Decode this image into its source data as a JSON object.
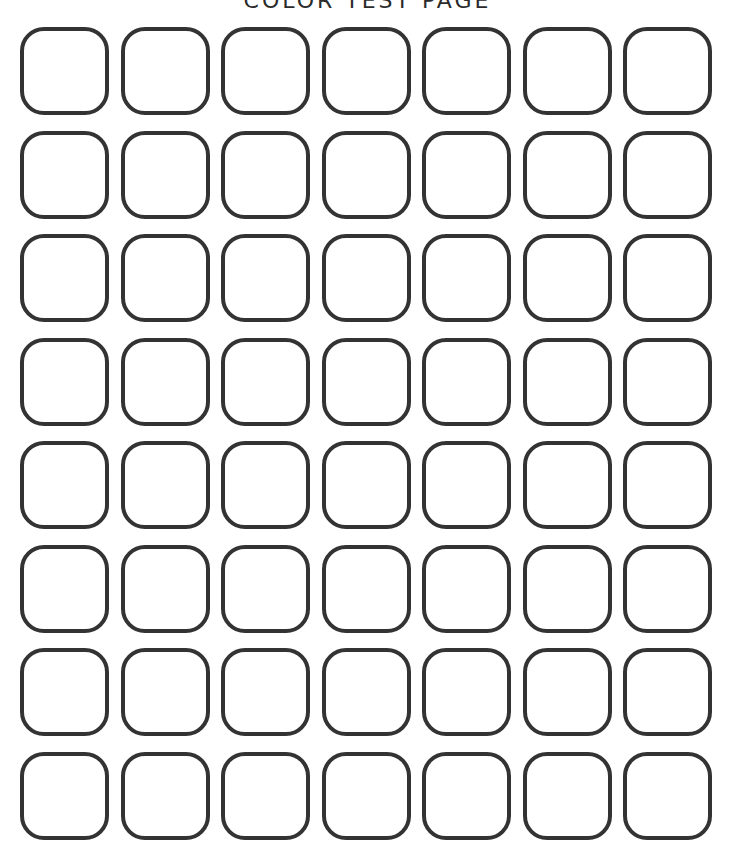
{
  "page": {
    "title": "COLOR TEST PAGE"
  },
  "grid": {
    "rows": 8,
    "columns": 7,
    "cell_shape": "rounded-square-outline",
    "stroke_color": "#333333",
    "fill_color": "#ffffff"
  }
}
